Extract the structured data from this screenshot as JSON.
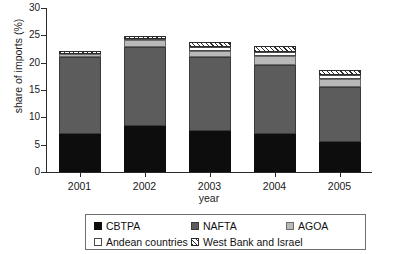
{
  "chart_data": {
    "type": "bar",
    "subtype": "stacked-vertical",
    "title": "",
    "xlabel": "year",
    "ylabel": "share of imports (%)",
    "categories": [
      "2001",
      "2002",
      "2003",
      "2004",
      "2005"
    ],
    "ylim": [
      0,
      30
    ],
    "yticks": [
      "0",
      "5",
      "10",
      "15",
      "20",
      "25",
      "30"
    ],
    "ytick_values": [
      0,
      5,
      10,
      15,
      20,
      25,
      30
    ],
    "grid": false,
    "legend_position": "bottom",
    "series": [
      {
        "name": "CBTPA",
        "color": "#0d0d0d",
        "pattern": "solid",
        "values": [
          7.0,
          8.4,
          7.5,
          7.0,
          5.5
        ]
      },
      {
        "name": "NAFTA",
        "color": "#5c5c5c",
        "pattern": "solid",
        "values": [
          14.0,
          14.5,
          13.5,
          12.5,
          10.0
        ]
      },
      {
        "name": "AGOA",
        "color": "#b9b9b9",
        "pattern": "solid",
        "values": [
          0.5,
          1.3,
          1.2,
          1.7,
          1.5
        ]
      },
      {
        "name": "Andean countries",
        "color": "#ffffff",
        "pattern": "solid",
        "values": [
          0.1,
          0.1,
          0.6,
          0.8,
          0.8
        ]
      },
      {
        "name": "West Bank and Israel",
        "color": "#ffffff",
        "pattern": "diagonal-hatch",
        "values": [
          0.5,
          0.6,
          0.9,
          1.0,
          0.9
        ]
      }
    ],
    "totals": [
      22.1,
      24.9,
      23.7,
      23.0,
      18.7
    ]
  },
  "legend": {
    "entries": [
      {
        "label": "CBTPA",
        "swatch": "solid-black"
      },
      {
        "label": "NAFTA",
        "swatch": "solid-darkgray"
      },
      {
        "label": "AGOA",
        "swatch": "solid-lightgray"
      },
      {
        "label": "Andean countries",
        "swatch": "solid-white"
      },
      {
        "label": "West Bank and Israel",
        "swatch": "diagonal-hatch"
      }
    ]
  }
}
